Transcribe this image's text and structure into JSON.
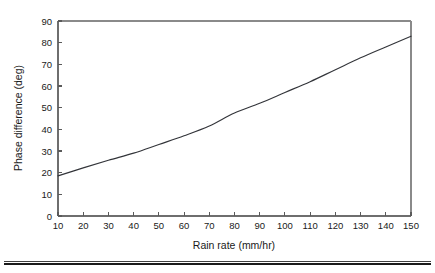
{
  "chart_data": {
    "type": "line",
    "title": "",
    "xlabel": "Rain rate (mm/hr)",
    "ylabel": "Phase difference (deg)",
    "xlim": [
      10,
      150
    ],
    "ylim": [
      0,
      90
    ],
    "grid": false,
    "legend": null,
    "xticks": [
      10,
      20,
      30,
      40,
      50,
      60,
      70,
      80,
      90,
      100,
      110,
      120,
      130,
      140,
      150
    ],
    "xtick_labels": [
      "10",
      "20",
      "30",
      "40",
      "50",
      "60",
      "70",
      "80",
      "90",
      "100",
      "110",
      "120",
      "130",
      "140",
      "150"
    ],
    "yticks": [
      0,
      10,
      20,
      30,
      40,
      50,
      60,
      70,
      80,
      90
    ],
    "ytick_labels": [
      "0",
      "10",
      "20",
      "30",
      "40",
      "50",
      "60",
      "70",
      "80",
      "90"
    ],
    "series": [
      {
        "name": "Phase difference vs rain rate",
        "color": "#33353a",
        "x": [
          10,
          20,
          30,
          40,
          50,
          60,
          70,
          80,
          90,
          100,
          110,
          120,
          130,
          140,
          150
        ],
        "values": [
          18.5,
          22.2,
          25.7,
          29.0,
          33.0,
          37.0,
          41.5,
          47.5,
          52.0,
          57.0,
          62.0,
          67.5,
          73.0,
          78.0,
          83.0
        ]
      }
    ]
  },
  "axes": {
    "x_title": "Rain rate (mm/hr)",
    "y_title": "Phase difference (deg)"
  },
  "figure": {
    "background_color": "#ffffff",
    "curve_color": "#33353a",
    "axis_color": "#6e6e6e",
    "text_color": "#1a1a1a"
  }
}
